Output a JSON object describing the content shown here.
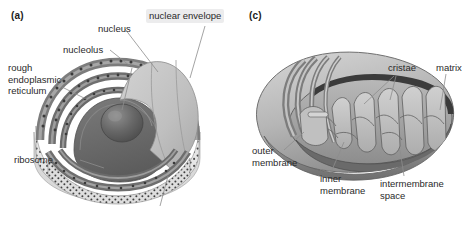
{
  "figure": {
    "background": "#ffffff",
    "panels": [
      {
        "id": "a",
        "tag": "(a)",
        "subject": "nucleus",
        "labels": [
          {
            "name": "nucleus",
            "text": "nucleus"
          },
          {
            "name": "nuclear-envelope",
            "text": "nuclear envelope"
          },
          {
            "name": "nucleolus",
            "text": "nucleolus"
          },
          {
            "name": "rough-er",
            "text": "rough\nendoplasmic\nreticulum"
          },
          {
            "name": "ribosome",
            "text": "ribosome"
          }
        ]
      },
      {
        "id": "c",
        "tag": "(c)",
        "subject": "mitochondrion",
        "labels": [
          {
            "name": "cristae",
            "text": "cristae"
          },
          {
            "name": "matrix",
            "text": "matrix"
          },
          {
            "name": "outer-membrane",
            "text": "outer\nmembrane"
          },
          {
            "name": "inner-membrane",
            "text": "inner\nmembrane"
          },
          {
            "name": "intermembrane-space",
            "text": "intermembrane\nspace"
          }
        ]
      }
    ],
    "palette": {
      "ink": "#2a2a2a",
      "leader": "#8d8d8d",
      "label_box": "#ececed",
      "dome_light": "#c9c9c9",
      "dome_mid": "#b4b4b4",
      "nucleus_dark": "#6f6f6f",
      "nucleus_darker": "#5d5d5d",
      "nucleolus": "#5a5a5a",
      "er_band": "#7a7a7a",
      "er_band_light": "#a8a8a8",
      "cytoplasm": "#e4e4e4",
      "stipple": "#4a4a4a",
      "mito_outer_light": "#cfcfcf",
      "mito_outer_mid": "#a9a9a9",
      "mito_outer_dark": "#8a8a8a",
      "mito_matrix": "#9a9a9a",
      "mito_matrix_dark": "#6d6d6d",
      "crista": "#c4c4c4",
      "crista_line": "#6a6a6a",
      "gap_dark": "#3d3d3d"
    }
  }
}
